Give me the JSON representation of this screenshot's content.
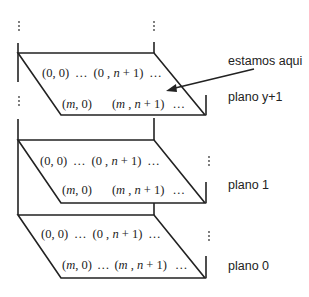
{
  "diagram": {
    "planes": [
      {
        "label": "plano y+1",
        "row_top": [
          "(0, 0)",
          "…",
          "(0 , n + 1)",
          "…"
        ],
        "row_bottom": [
          "(m, 0)",
          "",
          "(m , n + 1)",
          "…"
        ]
      },
      {
        "label": "plano 1",
        "row_top": [
          "(0, 0)",
          "…",
          "(0 , n + 1)",
          "…"
        ],
        "row_bottom": [
          "(m, 0)",
          "",
          "(m , n + 1)",
          "…"
        ]
      },
      {
        "label": "plano 0",
        "row_top": [
          "(0, 0)",
          "…",
          "(0 , n + 1)",
          "…"
        ],
        "row_bottom": [
          "(m, 0)",
          "…",
          "(m , n + 1)",
          "…"
        ]
      }
    ],
    "annotation": "estamos aqui",
    "vertical_ellipsis": "⋮"
  }
}
